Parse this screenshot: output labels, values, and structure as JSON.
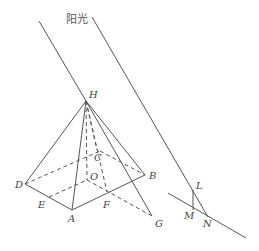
{
  "diagram": {
    "title": "阳光",
    "points": {
      "H": "H",
      "A": "A",
      "B": "B",
      "C": "C",
      "D": "D",
      "O": "O",
      "E": "E",
      "F": "F",
      "G": "G",
      "L": "L",
      "M": "M",
      "N": "N"
    },
    "solid_edges": [
      "HD",
      "HA",
      "HB",
      "HG",
      "DA",
      "AB",
      "BG",
      "LM",
      "LN",
      "ground-line",
      "sun-ray-1",
      "sun-ray-2"
    ],
    "dashed_edges": [
      "HO",
      "HC",
      "DC",
      "CB",
      "OA",
      "OE",
      "OG",
      "HF"
    ]
  }
}
